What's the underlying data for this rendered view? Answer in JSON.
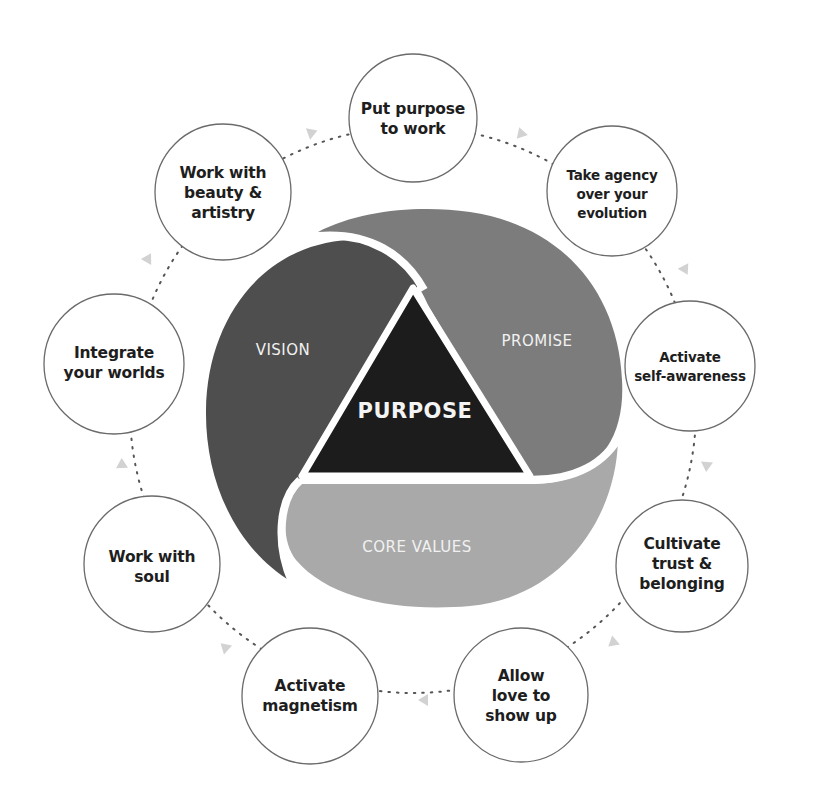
{
  "diagram": {
    "center": {
      "label": "PURPOSE",
      "color": "#1c1c1c"
    },
    "segments": [
      {
        "id": "vision",
        "label": "VISION",
        "color": "#4e4e4e"
      },
      {
        "id": "promise",
        "label": "PROMISE",
        "color": "#7c7c7c"
      },
      {
        "id": "core_values",
        "label": "CORE VALUES",
        "color": "#a9a9a9"
      }
    ],
    "cycle": [
      {
        "lines": [
          "Put purpose",
          "to work"
        ]
      },
      {
        "lines": [
          "Take agency",
          "over your",
          "evolution"
        ]
      },
      {
        "lines": [
          "Activate",
          "self-awareness"
        ]
      },
      {
        "lines": [
          "Cultivate",
          "trust &",
          "belonging"
        ]
      },
      {
        "lines": [
          "Allow",
          "love to",
          "show up"
        ]
      },
      {
        "lines": [
          "Activate",
          "magnetism"
        ]
      },
      {
        "lines": [
          "Work with",
          "soul"
        ]
      },
      {
        "lines": [
          "Integrate",
          "your worlds"
        ]
      },
      {
        "lines": [
          "Work with",
          "beauty &",
          "artistry"
        ]
      }
    ],
    "colors": {
      "node_stroke": "#6a6a6a",
      "connector": "#555555",
      "arrow": "#cfcfcf",
      "background": "#ffffff"
    }
  }
}
